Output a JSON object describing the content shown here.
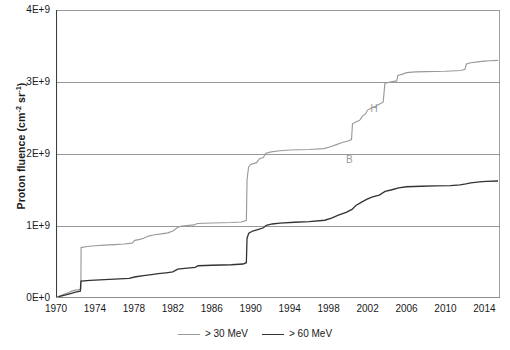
{
  "chart_data": {
    "type": "line",
    "title": "",
    "xlabel": "",
    "ylabel_text": "Proton fluence (cm",
    "ylabel_sup1": "-2",
    "ylabel_mid": " sr",
    "ylabel_sup2": "-1",
    "ylabel_end": ")",
    "ylabel_plain": "Proton fluence (cm-2 sr-1)",
    "xlim": [
      1970,
      2015.6
    ],
    "ylim": [
      0,
      4000000000
    ],
    "xticks": [
      1970,
      1974,
      1978,
      1982,
      1986,
      1990,
      1994,
      1998,
      2002,
      2006,
      2010,
      2014
    ],
    "xtick_labels": [
      "1970",
      "1974",
      "1978",
      "1982",
      "1986",
      "1990",
      "1994",
      "1998",
      "2002",
      "2006",
      "2010",
      "2014"
    ],
    "yticks": [
      0,
      1000000000,
      2000000000,
      3000000000,
      4000000000
    ],
    "ytick_labels": [
      "0E+0",
      "1E+9",
      "2E+9",
      "3E+9",
      "4E+9"
    ],
    "grid": "horizontal",
    "legend_position": "bottom-center",
    "colors": {
      "series_30mev": "#9a9a9a",
      "series_60mev": "#333333",
      "grid": "#8c8c8c",
      "axis": "#3d3d3d",
      "annotation": "#9a9a9a",
      "background": "#ffffff"
    },
    "annotations": [
      {
        "label": "B",
        "x": 2000.1,
        "y": 1920000000,
        "note": "Bastille-day era event marker"
      },
      {
        "label": "H",
        "x": 2002.6,
        "y": 2620000000,
        "note": "Halloween storms marker"
      }
    ],
    "series": [
      {
        "name": "> 30 MeV",
        "legend_label": "> 30 MeV",
        "color": "#9a9a9a",
        "points": [
          [
            1970.0,
            0
          ],
          [
            1970.4,
            30000000
          ],
          [
            1970.9,
            55000000
          ],
          [
            1971.3,
            75000000
          ],
          [
            1971.6,
            95000000
          ],
          [
            1972.0,
            110000000
          ],
          [
            1972.55,
            120000000
          ],
          [
            1972.58,
            700000000
          ],
          [
            1973.2,
            715000000
          ],
          [
            1974.0,
            725000000
          ],
          [
            1975.0,
            735000000
          ],
          [
            1976.0,
            742000000
          ],
          [
            1977.0,
            750000000
          ],
          [
            1977.8,
            762000000
          ],
          [
            1978.1,
            800000000
          ],
          [
            1978.6,
            815000000
          ],
          [
            1979.0,
            830000000
          ],
          [
            1979.5,
            860000000
          ],
          [
            1980.0,
            875000000
          ],
          [
            1981.0,
            895000000
          ],
          [
            1981.5,
            905000000
          ],
          [
            1982.0,
            930000000
          ],
          [
            1982.55,
            985000000
          ],
          [
            1982.9,
            1000000000
          ],
          [
            1984.2,
            1015000000
          ],
          [
            1984.5,
            1035000000
          ],
          [
            1986.0,
            1042000000
          ],
          [
            1988.0,
            1048000000
          ],
          [
            1989.0,
            1055000000
          ],
          [
            1989.55,
            1075000000
          ],
          [
            1989.62,
            1640000000
          ],
          [
            1989.78,
            1820000000
          ],
          [
            1990.0,
            1855000000
          ],
          [
            1990.6,
            1880000000
          ],
          [
            1990.9,
            1935000000
          ],
          [
            1991.3,
            1950000000
          ],
          [
            1991.55,
            2010000000
          ],
          [
            1992.1,
            2030000000
          ],
          [
            1993.0,
            2045000000
          ],
          [
            1994.0,
            2055000000
          ],
          [
            1996.0,
            2062000000
          ],
          [
            1997.5,
            2075000000
          ],
          [
            1998.2,
            2100000000
          ],
          [
            1998.8,
            2130000000
          ],
          [
            1999.4,
            2160000000
          ],
          [
            2000.0,
            2180000000
          ],
          [
            2000.35,
            2200000000
          ],
          [
            2000.45,
            2420000000
          ],
          [
            2000.8,
            2445000000
          ],
          [
            2001.2,
            2470000000
          ],
          [
            2001.5,
            2530000000
          ],
          [
            2001.8,
            2560000000
          ],
          [
            2002.0,
            2610000000
          ],
          [
            2002.4,
            2640000000
          ],
          [
            2002.9,
            2670000000
          ],
          [
            2003.2,
            2690000000
          ],
          [
            2003.6,
            2720000000
          ],
          [
            2003.78,
            2980000000
          ],
          [
            2004.3,
            3000000000
          ],
          [
            2005.0,
            3015000000
          ],
          [
            2005.1,
            3090000000
          ],
          [
            2005.6,
            3110000000
          ],
          [
            2006.0,
            3130000000
          ],
          [
            2006.9,
            3140000000
          ],
          [
            2008.0,
            3145000000
          ],
          [
            2010.0,
            3150000000
          ],
          [
            2011.6,
            3160000000
          ],
          [
            2012.0,
            3175000000
          ],
          [
            2012.15,
            3250000000
          ],
          [
            2012.6,
            3268000000
          ],
          [
            2013.3,
            3280000000
          ],
          [
            2014.0,
            3290000000
          ],
          [
            2014.5,
            3295000000
          ],
          [
            2015.4,
            3300000000
          ]
        ]
      },
      {
        "name": "> 60 MeV",
        "legend_label": "> 60 MeV",
        "color": "#333333",
        "points": [
          [
            1970.0,
            0
          ],
          [
            1970.5,
            25000000
          ],
          [
            1971.0,
            45000000
          ],
          [
            1971.5,
            62000000
          ],
          [
            1972.0,
            80000000
          ],
          [
            1972.5,
            95000000
          ],
          [
            1972.56,
            235000000
          ],
          [
            1973.5,
            245000000
          ],
          [
            1974.5,
            252000000
          ],
          [
            1976.0,
            262000000
          ],
          [
            1977.5,
            272000000
          ],
          [
            1978.2,
            295000000
          ],
          [
            1979.0,
            310000000
          ],
          [
            1979.8,
            325000000
          ],
          [
            1980.5,
            338000000
          ],
          [
            1981.3,
            350000000
          ],
          [
            1982.0,
            362000000
          ],
          [
            1982.5,
            400000000
          ],
          [
            1983.2,
            412000000
          ],
          [
            1984.3,
            425000000
          ],
          [
            1984.6,
            448000000
          ],
          [
            1986.0,
            455000000
          ],
          [
            1988.0,
            462000000
          ],
          [
            1989.2,
            472000000
          ],
          [
            1989.55,
            490000000
          ],
          [
            1989.62,
            830000000
          ],
          [
            1989.8,
            900000000
          ],
          [
            1990.2,
            930000000
          ],
          [
            1990.8,
            952000000
          ],
          [
            1991.3,
            975000000
          ],
          [
            1991.6,
            1010000000
          ],
          [
            1992.2,
            1028000000
          ],
          [
            1993.0,
            1040000000
          ],
          [
            1994.5,
            1052000000
          ],
          [
            1996.0,
            1062000000
          ],
          [
            1997.6,
            1080000000
          ],
          [
            1998.3,
            1110000000
          ],
          [
            1999.0,
            1150000000
          ],
          [
            1999.8,
            1190000000
          ],
          [
            2000.4,
            1230000000
          ],
          [
            2000.8,
            1285000000
          ],
          [
            2001.3,
            1325000000
          ],
          [
            2001.9,
            1370000000
          ],
          [
            2002.5,
            1405000000
          ],
          [
            2003.2,
            1430000000
          ],
          [
            2003.8,
            1480000000
          ],
          [
            2004.4,
            1500000000
          ],
          [
            2005.2,
            1530000000
          ],
          [
            2006.0,
            1545000000
          ],
          [
            2007.5,
            1552000000
          ],
          [
            2009.0,
            1556000000
          ],
          [
            2010.5,
            1562000000
          ],
          [
            2011.5,
            1572000000
          ],
          [
            2012.1,
            1585000000
          ],
          [
            2012.6,
            1600000000
          ],
          [
            2013.5,
            1612000000
          ],
          [
            2014.2,
            1620000000
          ],
          [
            2015.4,
            1625000000
          ]
        ]
      }
    ]
  }
}
